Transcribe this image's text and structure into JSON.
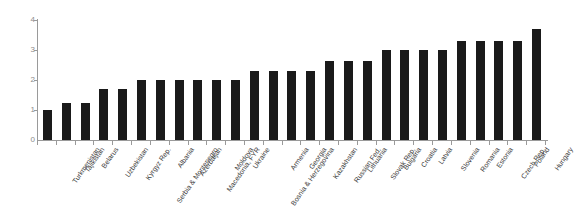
{
  "chart_data": {
    "type": "bar",
    "title": "",
    "subtitle": "",
    "xlabel": "",
    "ylabel": "",
    "ylim": [
      0,
      4
    ],
    "yticks": [
      0,
      1,
      2,
      3,
      4
    ],
    "ytick_labels": [
      "0",
      "1",
      "2",
      "3",
      "4"
    ],
    "grid": false,
    "legend": false,
    "bar_color": "#1a1a1a",
    "axis_color": "#9a9a9a",
    "background_color": "#ffffff",
    "categories": [
      "Turkmenistan",
      "Tajikistan",
      "Belarus",
      "Uzbekistan",
      "Kyrgyz Rep.",
      "Serbia & Montenegro",
      "Albania",
      "Azerbaijan",
      "Macedonia, FYR",
      "Moldova",
      "Ukraine",
      "Bosnia & Herzegovina",
      "Armenia",
      "Georgia",
      "Kazakhstan",
      "Russian Fed.",
      "Lithuania",
      "Slovak Rep.",
      "Bulgaria",
      "Croatia",
      "Latvia",
      "Slovenia",
      "Romania",
      "Estonia",
      "Czech Rep.",
      "Poland",
      "Hungary"
    ],
    "values": [
      1.0,
      1.25,
      1.25,
      1.7,
      1.7,
      2.0,
      2.0,
      2.0,
      2.0,
      2.0,
      2.0,
      2.3,
      2.3,
      2.3,
      2.3,
      2.65,
      2.65,
      2.65,
      3.0,
      3.0,
      3.0,
      3.0,
      3.3,
      3.3,
      3.3,
      3.3,
      3.7
    ]
  }
}
